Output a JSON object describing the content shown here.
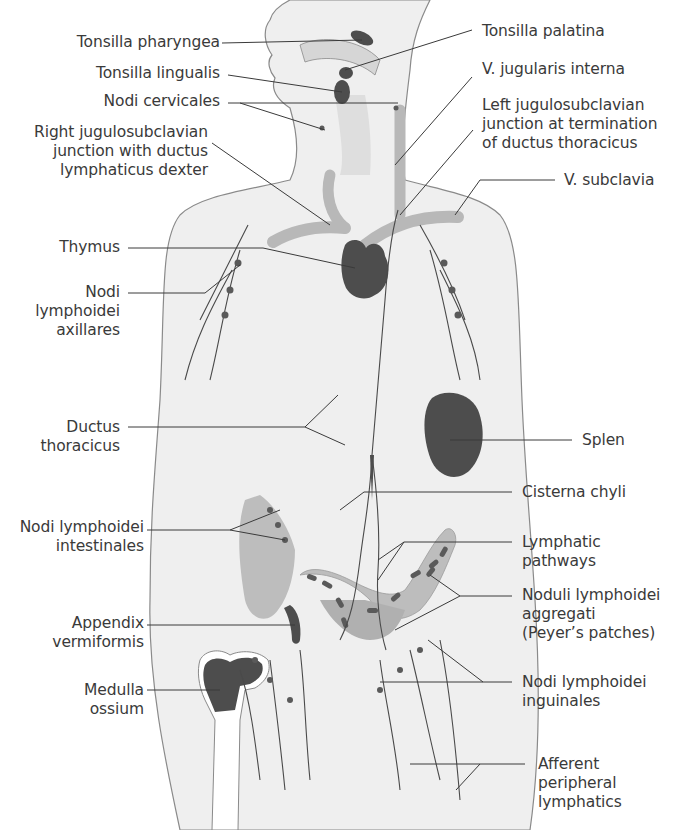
{
  "figure": {
    "colors": {
      "background": "#ffffff",
      "body_fill": "#efefef",
      "body_outline": "#8a8a8a",
      "vessel_stroke": "#4a4a4a",
      "vein_fill": "#b8b8b8",
      "organ_dark": "#4d4d4d",
      "intestine_fill": "#bdbdbd",
      "label_text": "#3a3a3a",
      "leader_line": "#3a3a3a"
    }
  },
  "labels_left": [
    {
      "id": "tonsilla-pharyngea",
      "lines": [
        "Tonsilla pharyngea"
      ]
    },
    {
      "id": "tonsilla-lingualis",
      "lines": [
        "Tonsilla lingualis"
      ]
    },
    {
      "id": "nodi-cervicales",
      "lines": [
        "Nodi cervicales"
      ]
    },
    {
      "id": "right-jugulosubclavian",
      "lines": [
        "Right jugulosubclavian",
        "junction with ductus",
        "lymphaticus dexter"
      ]
    },
    {
      "id": "thymus",
      "lines": [
        "Thymus"
      ]
    },
    {
      "id": "nodi-axillares",
      "lines": [
        "Nodi",
        "lymphoidei",
        "axillares"
      ]
    },
    {
      "id": "ductus-thoracicus",
      "lines": [
        "Ductus",
        "thoracicus"
      ]
    },
    {
      "id": "nodi-intestinales",
      "lines": [
        "Nodi lymphoidei",
        "intestinales"
      ]
    },
    {
      "id": "appendix-vermiformis",
      "lines": [
        "Appendix",
        "vermiformis"
      ]
    },
    {
      "id": "medulla-ossium",
      "lines": [
        "Medulla",
        "ossium"
      ]
    }
  ],
  "labels_right": [
    {
      "id": "tonsilla-palatina",
      "lines": [
        "Tonsilla palatina"
      ]
    },
    {
      "id": "v-jugularis-interna",
      "lines": [
        "V. jugularis interna"
      ]
    },
    {
      "id": "left-jugulosubclavian",
      "lines": [
        "Left jugulosubclavian",
        "junction at termination",
        "of ductus thoracicus"
      ]
    },
    {
      "id": "v-subclavia",
      "lines": [
        "V. subclavia"
      ]
    },
    {
      "id": "splen",
      "lines": [
        "Splen"
      ]
    },
    {
      "id": "cisterna-chyli",
      "lines": [
        "Cisterna chyli"
      ]
    },
    {
      "id": "lymphatic-pathways",
      "lines": [
        "Lymphatic",
        "pathways"
      ]
    },
    {
      "id": "noduli-aggregati",
      "lines": [
        "Noduli lymphoidei",
        "aggregati",
        "(Peyer’s patches)"
      ]
    },
    {
      "id": "nodi-inguinales",
      "lines": [
        "Nodi lymphoidei",
        "inguinales"
      ]
    },
    {
      "id": "afferent-lymphatics",
      "lines": [
        "Afferent",
        "peripheral",
        "lymphatics"
      ]
    }
  ]
}
